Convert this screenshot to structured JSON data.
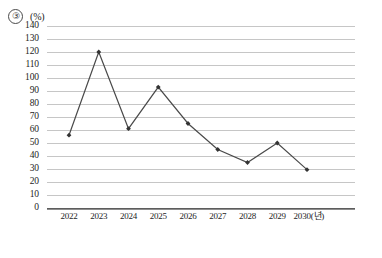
{
  "header": {
    "item_number": "③",
    "unit_label": "(%)"
  },
  "chart_data": {
    "type": "line",
    "title": "",
    "subtitle": "",
    "xlabel": "",
    "ylabel": "",
    "unit": "(%)",
    "categories": [
      "2022",
      "2023",
      "2024",
      "2025",
      "2026",
      "2027",
      "2028",
      "2029",
      "2030"
    ],
    "x_tick_labels": [
      "2022",
      "2023",
      "2024",
      "2025",
      "2026",
      "2027",
      "2028",
      "2029",
      "2030(년)"
    ],
    "x_axis_unit_note": "(년)",
    "values": [
      56,
      120,
      61,
      93,
      65,
      45,
      35,
      50,
      29.5
    ],
    "series": [
      {
        "name": "",
        "values": [
          56,
          120,
          61,
          93,
          65,
          45,
          35,
          50,
          29.5
        ]
      }
    ],
    "ylim": [
      0,
      140
    ],
    "y_tick_step": 10,
    "y_tick_labels": [
      "140",
      "130",
      "120",
      "110",
      "100",
      "90",
      "80",
      "70",
      "60",
      "50",
      "40",
      "30",
      "20",
      "10",
      "0"
    ],
    "grid": true,
    "grid_orientation": "horizontal",
    "legend": false,
    "legend_position": "none",
    "marker": "diamond",
    "line_color": "#4a4a4a",
    "marker_color": "#333333",
    "grid_color": "#c6c6c6",
    "axis_color": "#5d5d5d",
    "annotations": []
  }
}
